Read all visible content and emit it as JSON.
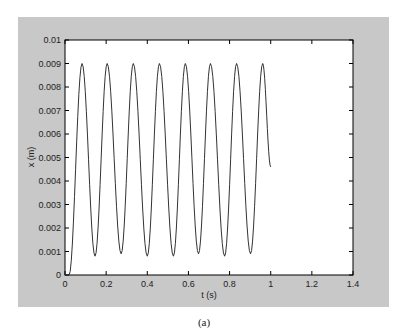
{
  "figure": {
    "caption": "(a)",
    "background_color": "#c8c8c8",
    "axes_color": "#ffffff",
    "line_color": "#333333"
  },
  "chart_data": {
    "type": "line",
    "title": "",
    "xlabel": "t (s)",
    "ylabel": "x (m)",
    "xlim": [
      0,
      1.4
    ],
    "ylim": [
      0,
      0.01
    ],
    "xticks": [
      0,
      0.2,
      0.4,
      0.6,
      0.8,
      1,
      1.2,
      1.4
    ],
    "xtick_labels": [
      "0",
      "0.2",
      "0.4",
      "0.6",
      "0.8",
      "1",
      "1.2",
      "1.4"
    ],
    "yticks": [
      0,
      0.001,
      0.002,
      0.003,
      0.004,
      0.005,
      0.006,
      0.007,
      0.008,
      0.009,
      0.01
    ],
    "ytick_labels": [
      "0",
      "0.001",
      "0.002",
      "0.003",
      "0.004",
      "0.005",
      "0.006",
      "0.007",
      "0.008",
      "0.009",
      "0.01"
    ],
    "grid": false,
    "legend": null,
    "series": [
      {
        "name": "x(t)",
        "description": "Oscillation between ~0.0008 and ~0.009 m, period ~0.126 s, starting at t~0.02 and ending at t=1.0",
        "x": [
          0,
          0.02,
          0.083,
          0.146,
          0.205,
          0.273,
          0.332,
          0.4,
          0.459,
          0.527,
          0.585,
          0.649,
          0.707,
          0.776,
          0.834,
          0.902,
          0.961,
          1.0
        ],
        "y": [
          0,
          0,
          0.009,
          0.0008,
          0.009,
          0.0009,
          0.009,
          0.0008,
          0.009,
          0.0008,
          0.009,
          0.0009,
          0.009,
          0.0008,
          0.009,
          0.0009,
          0.009,
          0.0046
        ]
      }
    ]
  }
}
